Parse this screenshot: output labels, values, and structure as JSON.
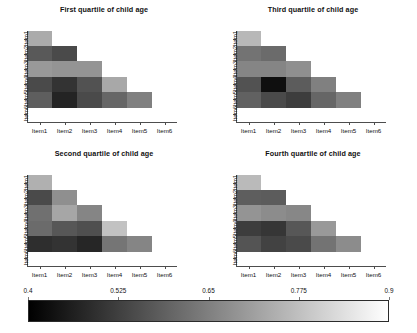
{
  "chart_data": {
    "type": "heatmap",
    "title": "",
    "xlabel": "",
    "ylabel": "",
    "grid": false,
    "legend_position": "bottom",
    "colorscale": {
      "name": "grayscale",
      "low_color": "#000000",
      "high_color": "#ffffff",
      "vmin": 0.4,
      "vmax": 0.9,
      "ticks": [
        "0.4",
        "0.525",
        "0.65",
        "0.775",
        "0.9"
      ],
      "tick_values": [
        0.4,
        0.525,
        0.65,
        0.775,
        0.9
      ]
    },
    "x_categories": [
      "Item1",
      "Item2",
      "Item3",
      "Item4",
      "Item5",
      "Item6"
    ],
    "y_categories": [
      "Item1",
      "Item2",
      "Item3",
      "Item4",
      "Item5",
      "Item6"
    ],
    "shape": "lower-triangular",
    "panels": [
      {
        "title": "First quartile of child age",
        "row_labels": [
          "Item1",
          "Item2",
          "Item3",
          "Item4",
          "Item5",
          "Item6"
        ],
        "col_labels": [
          "Item1",
          "Item2",
          "Item3",
          "Item4",
          "Item5",
          "Item6"
        ],
        "matrix": [
          [
            0.735,
            null,
            null,
            null,
            null,
            null
          ],
          [
            0.575,
            0.545,
            null,
            null,
            null,
            null
          ],
          [
            0.7,
            0.69,
            0.69,
            null,
            null,
            null
          ],
          [
            0.545,
            0.5,
            0.56,
            0.73,
            null,
            null
          ],
          [
            0.585,
            0.47,
            0.545,
            0.6,
            0.65,
            null
          ],
          [
            null,
            null,
            null,
            null,
            null,
            null
          ]
        ]
      },
      {
        "title": "Third quartile of child age",
        "row_labels": [
          "Item1",
          "Item2",
          "Item3",
          "Item4",
          "Item5",
          "Item6"
        ],
        "col_labels": [
          "Item1",
          "Item2",
          "Item3",
          "Item4",
          "Item5",
          "Item6"
        ],
        "matrix": [
          [
            0.76,
            null,
            null,
            null,
            null,
            null
          ],
          [
            0.625,
            0.61,
            null,
            null,
            null,
            null
          ],
          [
            0.66,
            0.66,
            0.68,
            null,
            null,
            null
          ],
          [
            0.56,
            0.43,
            0.58,
            0.65,
            null,
            null
          ],
          [
            0.59,
            0.545,
            0.52,
            0.6,
            0.65,
            null
          ],
          [
            null,
            null,
            null,
            null,
            null,
            null
          ]
        ]
      },
      {
        "title": "Second quartile of child age",
        "row_labels": [
          "Item1",
          "Item2",
          "Item3",
          "Item4",
          "Item5",
          "Item6"
        ],
        "col_labels": [
          "Item1",
          "Item2",
          "Item3",
          "Item4",
          "Item5",
          "Item6"
        ],
        "matrix": [
          [
            0.745,
            null,
            null,
            null,
            null,
            null
          ],
          [
            0.545,
            0.68,
            null,
            null,
            null,
            null
          ],
          [
            0.62,
            0.725,
            0.66,
            null,
            null,
            null
          ],
          [
            0.61,
            0.57,
            0.555,
            0.78,
            null,
            null
          ],
          [
            0.49,
            0.5,
            0.475,
            0.63,
            0.66,
            null
          ],
          [
            null,
            null,
            null,
            null,
            null,
            null
          ]
        ]
      },
      {
        "title": "Fourth quartile of child age",
        "row_labels": [
          "Item1",
          "Item2",
          "Item3",
          "Item4",
          "Item5",
          "Item6"
        ],
        "col_labels": [
          "Item1",
          "Item2",
          "Item3",
          "Item4",
          "Item5",
          "Item6"
        ],
        "matrix": [
          [
            0.765,
            null,
            null,
            null,
            null,
            null
          ],
          [
            0.585,
            0.58,
            null,
            null,
            null,
            null
          ],
          [
            0.69,
            0.675,
            0.665,
            null,
            null,
            null
          ],
          [
            0.52,
            0.505,
            0.57,
            0.7,
            null,
            null
          ],
          [
            0.565,
            0.53,
            0.545,
            0.625,
            0.675,
            null
          ],
          [
            null,
            null,
            null,
            null,
            null,
            null
          ]
        ]
      }
    ]
  }
}
